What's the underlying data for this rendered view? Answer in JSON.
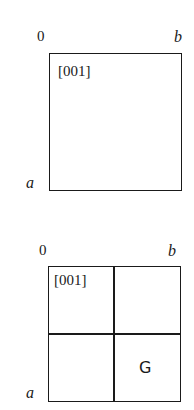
{
  "diagram1": {
    "origin_label": "0",
    "b_label": "b",
    "a_label": "a",
    "direction_label": "[001]"
  },
  "diagram2": {
    "origin_label": "0",
    "b_label": "b",
    "a_label": "a",
    "direction_label": "[001]",
    "cell_label": "G"
  }
}
